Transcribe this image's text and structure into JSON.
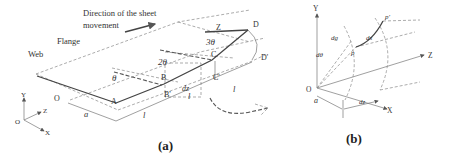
{
  "panel_a": {
    "caption": "(a)",
    "direction_label_line1": "Direction of the sheet",
    "direction_label_line2": "movement",
    "flange_label": "Flange",
    "web_label": "Web",
    "points": {
      "O": "O",
      "A": "A",
      "B": "B",
      "B_prime": "B'",
      "C": "C",
      "C_prime": "C'",
      "D": "D",
      "D_prime": "D'",
      "Z": "Z"
    },
    "angles": {
      "theta": "θ",
      "two_theta": "2θ",
      "three_theta": "3θ"
    },
    "dims": {
      "a": "a",
      "l1": "l",
      "l2": "l",
      "l3": "l",
      "dz": "dz"
    },
    "axes": {
      "Y": "Y",
      "Z": "Z",
      "X": "X",
      "O": "O"
    }
  },
  "panel_b": {
    "caption": "(b)",
    "axes": {
      "Y": "Y",
      "Z": "Z",
      "X": "X",
      "O": "O"
    },
    "labels": {
      "dg": "dg",
      "ds": "ds",
      "dtheta": "dθ",
      "p": "p",
      "p_prime": "p'",
      "a": "a",
      "dz": "dz"
    }
  }
}
